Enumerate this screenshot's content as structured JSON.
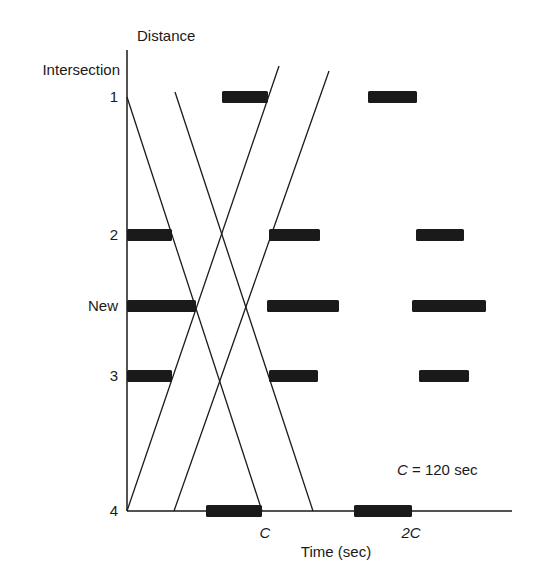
{
  "diagram": {
    "type": "time-space diagram",
    "y_axis_title": "Distance",
    "y_axis_subtitle": "Intersection",
    "x_axis_title": "Time (sec)",
    "x_ticks": [
      {
        "label": "C",
        "x": 265
      },
      {
        "label": "2C",
        "x": 411
      }
    ],
    "annotation": {
      "var": "C",
      "text": " = 120 sec"
    },
    "intersections": [
      {
        "label": "1",
        "y": 97
      },
      {
        "label": "2",
        "y": 235
      },
      {
        "label": "New",
        "y": 306
      },
      {
        "label": "3",
        "y": 376
      },
      {
        "label": "4",
        "y": 511
      }
    ],
    "red_phases": [
      {
        "intersection": "1",
        "bars": [
          [
            222,
            268
          ],
          [
            368,
            417
          ]
        ]
      },
      {
        "intersection": "2",
        "bars": [
          [
            127,
            172
          ],
          [
            269,
            320
          ],
          [
            416,
            464
          ]
        ]
      },
      {
        "intersection": "New",
        "bars": [
          [
            127,
            196
          ],
          [
            267,
            339
          ],
          [
            412,
            486
          ]
        ]
      },
      {
        "intersection": "3",
        "bars": [
          [
            127,
            172
          ],
          [
            269,
            318
          ],
          [
            419,
            469
          ]
        ]
      },
      {
        "intersection": "4",
        "bars": [
          [
            206,
            262
          ],
          [
            354,
            412
          ]
        ]
      }
    ],
    "bands": {
      "southbound": [
        [
          127,
          97,
          262,
          511
        ],
        [
          175,
          92,
          313,
          511
        ]
      ],
      "northbound": [
        [
          127,
          511,
          279,
          66
        ],
        [
          174,
          511,
          329,
          71
        ]
      ]
    },
    "colors": {
      "ink": "#1a1a1a",
      "background": "#ffffff"
    }
  }
}
